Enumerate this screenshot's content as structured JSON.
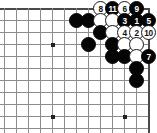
{
  "board": {
    "type": "go-board-diagram",
    "description": "Go joseki diagram, upper-right corner",
    "grid": {
      "origin_x": 4,
      "origin_y": 8,
      "spacing": 12,
      "cols": 13,
      "rows": 11,
      "right_edge_col": 12,
      "top_edge_row": 0,
      "line_color": "#8c8c8c",
      "edge_color": "#4a4a4a",
      "background": "#ffffff"
    },
    "hoshi": [
      {
        "col": 4,
        "row": 3
      },
      {
        "col": 4,
        "row": 9
      },
      {
        "col": 10,
        "row": 9
      }
    ],
    "stones": [
      {
        "col": 6,
        "row": 1,
        "color": "black",
        "label": ""
      },
      {
        "col": 7,
        "row": 1,
        "color": "black",
        "label": ""
      },
      {
        "col": 8,
        "row": 0,
        "color": "white",
        "label": "8"
      },
      {
        "col": 9,
        "row": 0,
        "color": "black",
        "label": "11"
      },
      {
        "col": 10,
        "row": 0,
        "color": "white",
        "label": "6"
      },
      {
        "col": 11,
        "row": 0,
        "color": "black",
        "label": "9"
      },
      {
        "col": 8,
        "row": 1,
        "color": "white",
        "label": ""
      },
      {
        "col": 9,
        "row": 1,
        "color": "white",
        "label": ""
      },
      {
        "col": 10,
        "row": 1,
        "color": "black",
        "label": "3"
      },
      {
        "col": 11,
        "row": 1,
        "color": "black",
        "label": "1"
      },
      {
        "col": 12,
        "row": 1,
        "color": "black",
        "label": "5"
      },
      {
        "col": 8,
        "row": 2,
        "color": "black",
        "label": ""
      },
      {
        "col": 9,
        "row": 2,
        "color": "white",
        "label": ""
      },
      {
        "col": 10,
        "row": 2,
        "color": "white",
        "label": "4"
      },
      {
        "col": 11,
        "row": 2,
        "color": "white",
        "label": "2"
      },
      {
        "col": 12,
        "row": 2,
        "color": "white",
        "label": "10"
      },
      {
        "col": 7,
        "row": 3,
        "color": "black",
        "label": ""
      },
      {
        "col": 9,
        "row": 3,
        "color": "black",
        "label": ""
      },
      {
        "col": 10,
        "row": 3,
        "color": "white",
        "label": ""
      },
      {
        "col": 11,
        "row": 3,
        "color": "white",
        "label": ""
      },
      {
        "col": 9,
        "row": 4,
        "color": "black",
        "label": ""
      },
      {
        "col": 10,
        "row": 4,
        "color": "black",
        "label": ""
      },
      {
        "col": 11,
        "row": 4,
        "color": "white",
        "label": ""
      },
      {
        "col": 12,
        "row": 4,
        "color": "black",
        "label": "7"
      },
      {
        "col": 11,
        "row": 5,
        "color": "black",
        "label": ""
      },
      {
        "col": 11,
        "row": 6,
        "color": "black",
        "label": ""
      }
    ]
  }
}
